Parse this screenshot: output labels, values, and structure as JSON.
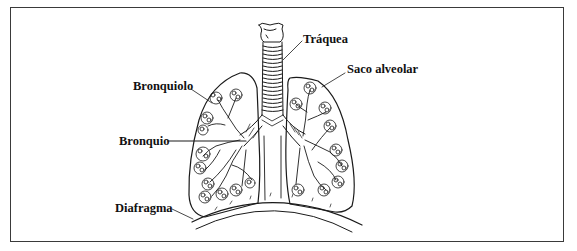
{
  "diagram": {
    "labels": {
      "trachea": "Tráquea",
      "alveolar_sac": "Saco alveolar",
      "bronchiole": "Bronquiolo",
      "bronchus": "Bronquio",
      "diaphragm": "Diafragma"
    },
    "colors": {
      "line": "#1a1a1a",
      "frame": "#3a3a3a",
      "background": "#ffffff"
    }
  }
}
